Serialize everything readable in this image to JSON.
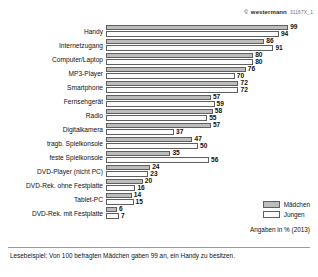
{
  "credit": {
    "mark": "©",
    "brand": "westermann",
    "code": "31167X_1"
  },
  "legend": {
    "items": [
      {
        "label": "Mädchen",
        "color": "#bdbdbd"
      },
      {
        "label": "Jungen",
        "color": "#fbfbfb"
      }
    ]
  },
  "units_note": "Angaben in % (2013)",
  "footnote": "Lesebeispiel: Von 100 befragten Mädchen gaben 99 an, ein Handy zu besitzen.",
  "chart_data": {
    "type": "bar",
    "orientation": "horizontal",
    "title": "",
    "xlabel": "",
    "ylabel": "",
    "xlim": [
      0,
      100
    ],
    "grid": false,
    "legend_position": "bottom-right",
    "categories": [
      "Handy",
      "Internetzugang",
      "Computer/Laptop",
      "MP3-Player",
      "Smartphone",
      "Fernsehgerät",
      "Radio",
      "Digitalkamera",
      "tragb. Spielkonsole",
      "feste Spielkonsole",
      "DVD-Player (nicht PC)",
      "DVD-Rek. ohne Festplatte",
      "Tablet-PC",
      "DVD-Rek. mit Festplatte"
    ],
    "series": [
      {
        "name": "Mädchen",
        "color": "#bdbdbd",
        "values": [
          99,
          86,
          80,
          76,
          72,
          57,
          58,
          57,
          47,
          35,
          24,
          20,
          14,
          6
        ]
      },
      {
        "name": "Jungen",
        "color": "#fbfbfb",
        "values": [
          94,
          91,
          80,
          70,
          72,
          59,
          55,
          37,
          50,
          56,
          23,
          16,
          15,
          7
        ]
      }
    ]
  }
}
